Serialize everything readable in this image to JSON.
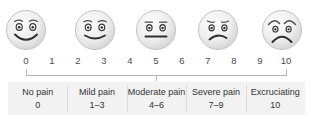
{
  "diagram": {
    "type": "pain-rating-scale"
  },
  "scale": {
    "numbers": [
      "0",
      "1",
      "2",
      "3",
      "4",
      "5",
      "6",
      "7",
      "8",
      "9",
      "10"
    ],
    "min": 0,
    "max": 10,
    "tick_positions": [
      0,
      5,
      10
    ]
  },
  "faces": [
    {
      "name": "face-no-pain",
      "expression": "broad-smile",
      "value": 0,
      "position_percent": 0
    },
    {
      "name": "face-mild-pain",
      "expression": "slight-smile",
      "value": 2.5,
      "position_percent": 25
    },
    {
      "name": "face-moderate-pain",
      "expression": "neutral-flat",
      "value": 5,
      "position_percent": 50
    },
    {
      "name": "face-severe-pain",
      "expression": "frown",
      "value": 7.5,
      "position_percent": 75
    },
    {
      "name": "face-excruciating",
      "expression": "anguished-frown",
      "value": 10,
      "position_percent": 100
    }
  ],
  "categories": [
    {
      "title": "No pain",
      "range": "0"
    },
    {
      "title": "Mild pain",
      "range": "1–3"
    },
    {
      "title": "Moderate pain",
      "range": "4–6"
    },
    {
      "title": "Severe pain",
      "range": "7–9"
    },
    {
      "title": "Excruciating",
      "range": "10"
    }
  ],
  "colors": {
    "face_fill_light": "#f4f4f4",
    "face_fill_dark": "#d8d8d8",
    "face_stroke": "#bdbdbd",
    "feature_stroke": "#3a3a3a",
    "axis": "#b6b6b6",
    "table_background": "#f2f2f2",
    "divider": "#dcdcdc",
    "text": "#333333",
    "number_text": "#4a4a4a"
  }
}
